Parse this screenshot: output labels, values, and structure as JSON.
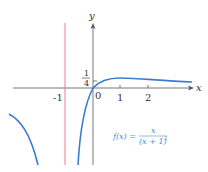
{
  "diagram": {
    "axes": {
      "x_label": "x",
      "y_label": "y",
      "x_ticks": [
        "-1",
        "0",
        "1",
        "2"
      ],
      "y_tick_label_num": "1",
      "y_tick_label_den": "4"
    },
    "asymptote": {
      "x": -1,
      "color": "#e0707a"
    },
    "curve": {
      "color": "#3b7bd0"
    },
    "formula": {
      "lhs": "f(x) =",
      "numerator": "x",
      "denominator": "(x + 1)",
      "exponent": "2"
    }
  }
}
